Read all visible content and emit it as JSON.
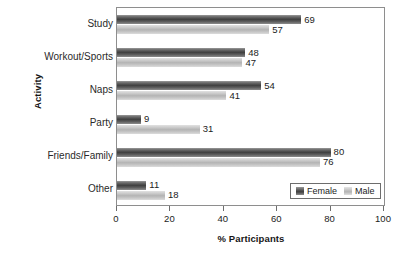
{
  "chart_data": {
    "type": "bar",
    "orientation": "horizontal",
    "title": "",
    "xlabel": "% Participants",
    "ylabel": "Activity",
    "categories": [
      "Study",
      "Workout/Sports",
      "Naps",
      "Party",
      "Friends/Family",
      "Other"
    ],
    "series": [
      {
        "name": "Female",
        "values": [
          69,
          48,
          54,
          9,
          80,
          11
        ],
        "color": "#4a4a4a"
      },
      {
        "name": "Male",
        "values": [
          57,
          47,
          41,
          31,
          76,
          18
        ],
        "color": "#c4c4c4"
      }
    ],
    "xlim": [
      0,
      100
    ],
    "xticks": [
      0,
      20,
      40,
      60,
      80,
      100
    ],
    "xtick_labels": [
      "0",
      "20",
      "40",
      "60",
      "80",
      "100"
    ],
    "grid": false,
    "legend_position": "bottom-right",
    "data_labels": true
  },
  "legend": {
    "entries": [
      {
        "label": "Female",
        "swatch": "female"
      },
      {
        "label": "Male",
        "swatch": "male"
      }
    ]
  }
}
